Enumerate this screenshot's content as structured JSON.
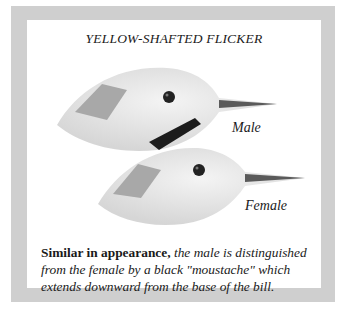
{
  "title": "YELLOW-SHAFTED FLICKER",
  "illustrations": [
    {
      "label": "Male",
      "feature": "black moustache"
    },
    {
      "label": "Female"
    }
  ],
  "caption": {
    "lead": "Similar in appearance,",
    "body": " the male is distinguished from the female by a black \"moustache\" which extends downward from the base of the bill."
  },
  "colors": {
    "frame": "#cfcfcf",
    "panel": "#ffffff",
    "crown_patch": "#9a9a9a",
    "moustache": "#1c1c1c"
  }
}
